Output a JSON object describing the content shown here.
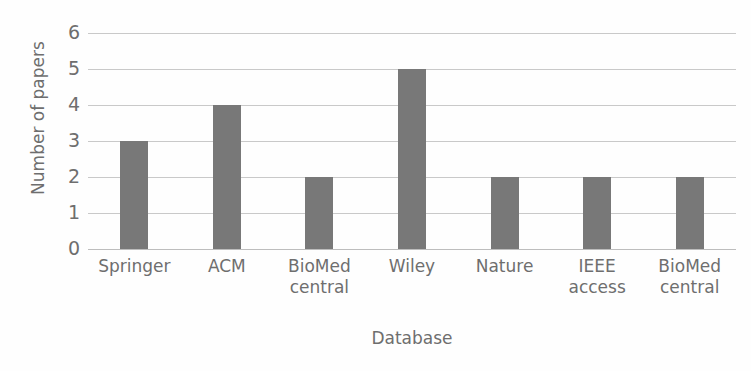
{
  "chart_data": {
    "type": "bar",
    "title": "",
    "subtitle": "",
    "xlabel": "Database",
    "ylabel": "Number of papers",
    "categories": [
      "Springer",
      "ACM",
      "BioMed central",
      "Wiley",
      "Nature",
      "IEEE access",
      "BioMed central"
    ],
    "category_lines": [
      [
        "Springer"
      ],
      [
        "ACM"
      ],
      [
        "BioMed",
        "central"
      ],
      [
        "Wiley"
      ],
      [
        "Nature"
      ],
      [
        "IEEE",
        "access"
      ],
      [
        "BioMed",
        "central"
      ]
    ],
    "values": [
      3,
      4,
      2,
      5,
      2,
      2,
      2
    ],
    "ylim": [
      0,
      6
    ],
    "ytick_labels": [
      "6",
      "5",
      "4",
      "3",
      "2",
      "1",
      "0"
    ],
    "ytick_values": [
      6,
      5,
      4,
      3,
      2,
      1,
      0
    ],
    "y_tick_step": 1,
    "grid": true,
    "grid_axis": "y",
    "legend": false,
    "legend_position": "none",
    "orientation": "vertical",
    "colors": {
      "bar_fill": "#787878",
      "gridline": "#c9c9c9",
      "axis_line": "#bdbdbd",
      "text": "#6e6e6e",
      "background": "#fefefe"
    }
  },
  "scan_artifacts": {
    "bleed_through": [
      "",
      "",
      "",
      ""
    ]
  }
}
